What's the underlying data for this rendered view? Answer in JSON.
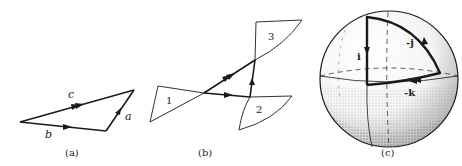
{
  "panels": [
    {
      "id": "a",
      "caption": "(a)",
      "title": "Vector addition triangle",
      "labels": {
        "c": "c",
        "b": "b",
        "a": "a"
      }
    },
    {
      "id": "b",
      "caption": "(b)",
      "title": "Composition of rotations via spherical triangles",
      "labels": {
        "t1": "1",
        "t2": "2",
        "t3": "3"
      }
    },
    {
      "id": "c",
      "caption": "(c)",
      "title": "Sphere with quaternion unit path",
      "labels": {
        "i": "i",
        "minus_j": "-j",
        "minus_k": "-k"
      }
    }
  ],
  "colors": {
    "ink": "#1a1a1a",
    "background": "#ffffff",
    "stipple": "#555555"
  }
}
